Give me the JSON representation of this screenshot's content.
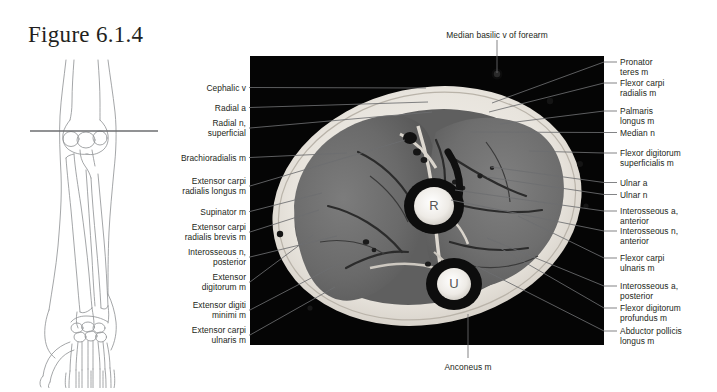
{
  "figure": {
    "title": "Figure 6.1.4",
    "caption_region": "axial MRI cross-section of right forearm"
  },
  "orientation_diagram": {
    "name": "forearm-skeleton-outline",
    "section_line_label": ""
  },
  "mri": {
    "bone_markers": [
      {
        "label": "R",
        "x": 184,
        "y": 150
      },
      {
        "label": "U",
        "x": 204,
        "y": 228
      }
    ]
  },
  "labels": {
    "top": [
      {
        "text": "Median basilic v of forearm",
        "x": 497,
        "y": 30,
        "anchor": "center",
        "lx": 497,
        "ly": 40,
        "tx": 497,
        "ty": 73
      }
    ],
    "bottom": [
      {
        "text": "Anconeus m",
        "x": 468,
        "y": 362,
        "anchor": "center",
        "lx": 468,
        "ly": 358,
        "tx": 468,
        "ty": 314
      }
    ],
    "left": [
      {
        "text": "Cephalic v",
        "y": 83,
        "lines": 1,
        "tx": 426,
        "ty": 88
      },
      {
        "text": "Radial a",
        "y": 103,
        "lines": 1,
        "tx": 428,
        "ty": 102
      },
      {
        "text": "Radial n,\nsuperficial",
        "y": 118,
        "lines": 2,
        "tx": 432,
        "ty": 112
      },
      {
        "text": "Brachioradialis m",
        "y": 153,
        "lines": 1,
        "tx": 347,
        "ty": 153
      },
      {
        "text": "Extensor carpi\nradialis longus m",
        "y": 176,
        "lines": 2,
        "tx": 405,
        "ty": 140
      },
      {
        "text": "Supinator m",
        "y": 207,
        "lines": 1,
        "tx": 322,
        "ty": 193
      },
      {
        "text": "Extensor carpi\nradialis brevis m",
        "y": 222,
        "lines": 2,
        "tx": 319,
        "ty": 210
      },
      {
        "text": "Interosseous n,\nposterior",
        "y": 247,
        "lines": 2,
        "tx": 337,
        "ty": 236
      },
      {
        "text": "Extensor\ndigitorum m",
        "y": 272,
        "lines": 2,
        "tx": 313,
        "ty": 235
      },
      {
        "text": "Extensor digiti\nminimi m",
        "y": 300,
        "lines": 2,
        "tx": 340,
        "ty": 263
      },
      {
        "text": "Extensor carpi\nulnaris m",
        "y": 325,
        "lines": 2,
        "tx": 335,
        "ty": 287
      }
    ],
    "right": [
      {
        "text": "Pronator\nteres m",
        "y": 57,
        "lines": 2,
        "tx": 492,
        "ty": 103
      },
      {
        "text": "Flexor carpi\nradialis m",
        "y": 78,
        "lines": 2,
        "tx": 489,
        "ty": 112
      },
      {
        "text": "Palmaris\nlongus m",
        "y": 106,
        "lines": 2,
        "tx": 500,
        "ty": 124
      },
      {
        "text": "Median n",
        "y": 128,
        "lines": 1,
        "tx": 470,
        "ty": 132
      },
      {
        "text": "Flexor digitorum\nsuperficialis m",
        "y": 148,
        "lines": 2,
        "tx": 529,
        "ty": 151
      },
      {
        "text": "Ulnar a",
        "y": 178,
        "lines": 1,
        "tx": 491,
        "ty": 167
      },
      {
        "text": "Ulnar n",
        "y": 190,
        "lines": 1,
        "tx": 487,
        "ty": 177
      },
      {
        "text": "Interosseous a,\nanterior",
        "y": 206,
        "lines": 2,
        "tx": 455,
        "ty": 190
      },
      {
        "text": "Interosseous n,\nanterior",
        "y": 226,
        "lines": 2,
        "tx": 451,
        "ty": 200
      },
      {
        "text": "Flexor carpi\nulnaris m",
        "y": 253,
        "lines": 2,
        "tx": 518,
        "ty": 216
      },
      {
        "text": "Interosseous a,\nposterior",
        "y": 281,
        "lines": 2,
        "tx": 487,
        "ty": 238
      },
      {
        "text": "Flexor digitorum\nprofundus m",
        "y": 303,
        "lines": 2,
        "tx": 500,
        "ty": 248
      },
      {
        "text": "Abductor pollicis\nlongus m",
        "y": 326,
        "lines": 2,
        "tx": 476,
        "ty": 266
      }
    ]
  },
  "colors": {
    "text": "#231f20",
    "leader": "#6d6e70",
    "panel_bg": "#050505",
    "page_bg": "#ffffff"
  }
}
